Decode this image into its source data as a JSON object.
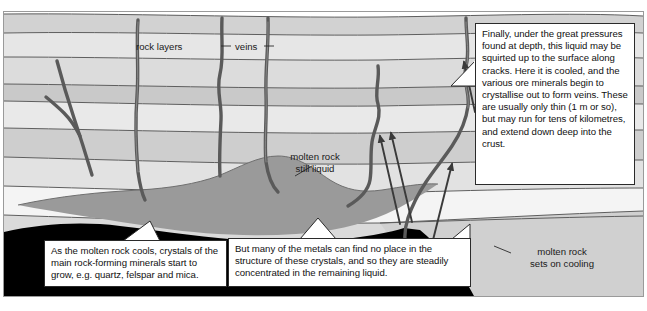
{
  "diagram": {
    "type": "geological-cross-section",
    "colors": {
      "background": "#ffffff",
      "stratum_light": "#ededed",
      "stratum_mid": "#d9d9d9",
      "stratum_dark": "#c3c3c3",
      "stratum_pale": "#f6f6f6",
      "magma_liquid": "#9a9a9a",
      "magma_solid": "#000000",
      "vein": "#5a5a5a",
      "outline": "#4a4a4a",
      "callout_border": "#2a2a2a",
      "text": "#111111"
    }
  },
  "labels": {
    "rock_layers": "rock layers",
    "veins": "veins",
    "molten_rock_still_liquid_line1": "molten rock",
    "molten_rock_still_liquid_line2": "still liquid",
    "molten_rock_sets_line1": "molten rock",
    "molten_rock_sets_line2": "sets on cooling"
  },
  "callouts": {
    "finally": "Finally, under the great pressures found at depth, this liquid may be squirted up to the surface along cracks. Here it is cooled, and the various ore minerals begin to crystallise out to form veins. These are usually only thin (1 m or so), but may run for tens of kilometres, and extend down deep into the crust.",
    "cools": "As the molten rock cools, crystals of the main rock-forming minerals start to grow, e.g. quartz, felspar and mica.",
    "metals": "But many of the metals can find no place in the structure of these crystals, and so they are steadily concentrated in the remaining liquid."
  },
  "annotations": {
    "arrow_count": 4,
    "arrow_direction": "upward",
    "vein_count": 6
  }
}
